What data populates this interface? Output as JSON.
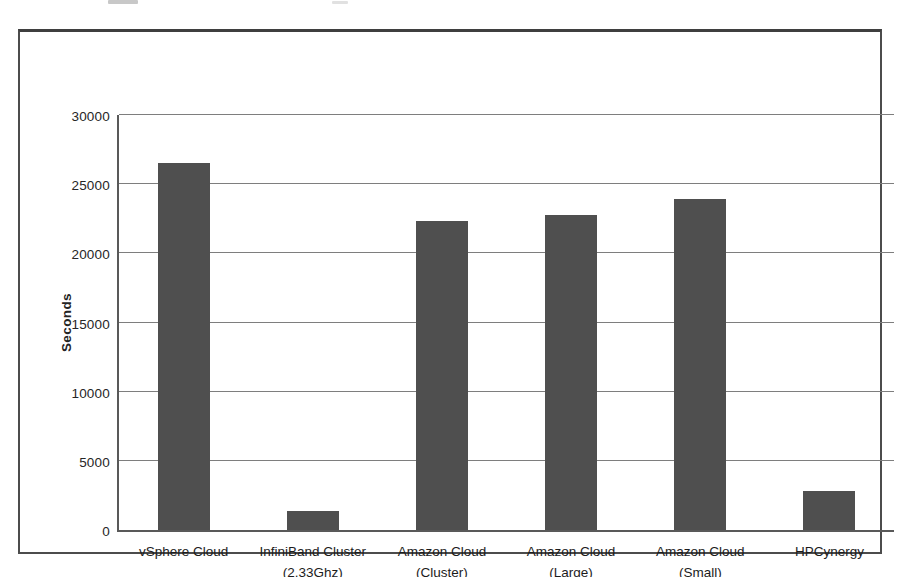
{
  "colors": {
    "bar": "#4f4f4f",
    "gridline": "#7e7e7e",
    "axis": "#595959",
    "frame_border": "#4c4c4c",
    "text": "#262626",
    "background": "#ffffff"
  },
  "chart_data": {
    "type": "bar",
    "title": "",
    "categories": [
      "vSphere Cloud",
      "InfiniBand Cluster\n(2.33Ghz)",
      "Amazon Cloud\n(Cluster)",
      "Amazon Cloud\n(Large)",
      "Amazon Cloud\n(Small)",
      "HPCynergy"
    ],
    "values": [
      25300,
      1300,
      21300,
      21700,
      22800,
      2700
    ],
    "xlabel": "",
    "ylabel": "Seconds",
    "ylim": [
      0,
      30000
    ],
    "yticks": [
      0,
      5000,
      10000,
      15000,
      20000,
      25000,
      30000
    ],
    "grid": "horizontal",
    "legend": "none"
  }
}
